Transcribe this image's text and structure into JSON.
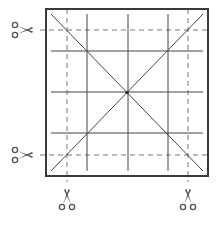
{
  "diagram": {
    "title": "",
    "colors": {
      "border": "#3a3a3a",
      "solid_line": "#444444",
      "dashed_line": "#777777",
      "scissors": "#555555"
    },
    "square": {
      "x": 46,
      "y": 9,
      "size_w": 162,
      "size_h": 167
    },
    "solid_verticals_x": [
      87,
      128,
      168
    ],
    "solid_horizontals_y": [
      51,
      92,
      133
    ],
    "dashed_verticals_x": [
      67,
      188
    ],
    "dashed_horizontals_y": [
      30,
      155
    ],
    "scissors": [
      {
        "name": "scissors-left-top",
        "x": 22,
        "y": 30,
        "direction": "right"
      },
      {
        "name": "scissors-left-bottom",
        "x": 22,
        "y": 155,
        "direction": "right"
      },
      {
        "name": "scissors-bottom-left",
        "x": 67,
        "y": 200,
        "direction": "up"
      },
      {
        "name": "scissors-bottom-right",
        "x": 188,
        "y": 200,
        "direction": "up"
      }
    ]
  }
}
